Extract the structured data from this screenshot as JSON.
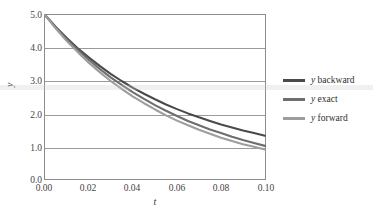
{
  "chart_data": {
    "type": "line",
    "title": "",
    "subtitle": "",
    "xlabel": "t",
    "ylabel": "y",
    "xlim": [
      0.0,
      0.1
    ],
    "ylim": [
      0.0,
      5.0
    ],
    "xticks": [
      "0.00",
      "0.02",
      "0.04",
      "0.06",
      "0.08",
      "0.10"
    ],
    "xtick_values": [
      0.0,
      0.02,
      0.04,
      0.06,
      0.08,
      0.1
    ],
    "yticks": [
      "0.0",
      "1.0",
      "2.0",
      "3.0",
      "4.0",
      "5.0"
    ],
    "ytick_values": [
      0.0,
      1.0,
      2.0,
      3.0,
      4.0,
      5.0
    ],
    "grid": "horizontal",
    "legend_position": "right",
    "x": [
      0.0,
      0.005,
      0.01,
      0.015,
      0.02,
      0.025,
      0.03,
      0.035,
      0.04,
      0.045,
      0.05,
      0.055,
      0.06,
      0.065,
      0.07,
      0.075,
      0.08,
      0.085,
      0.09,
      0.095,
      0.1
    ],
    "series": [
      {
        "name": "y backward",
        "color": "#4a4a4a",
        "values": [
          5.0,
          4.63,
          4.29,
          3.98,
          3.7,
          3.44,
          3.2,
          2.98,
          2.78,
          2.6,
          2.43,
          2.27,
          2.13,
          2.0,
          1.88,
          1.77,
          1.66,
          1.57,
          1.48,
          1.4,
          1.32
        ]
      },
      {
        "name": "y exact",
        "color": "#6e6e6e",
        "values": [
          5.0,
          4.61,
          4.25,
          3.93,
          3.63,
          3.35,
          3.09,
          2.86,
          2.64,
          2.44,
          2.25,
          2.08,
          1.92,
          1.77,
          1.64,
          1.51,
          1.4,
          1.29,
          1.19,
          1.1,
          1.01
        ]
      },
      {
        "name": "y forward",
        "color": "#9d9d9d",
        "values": [
          5.0,
          4.58,
          4.2,
          3.86,
          3.54,
          3.25,
          2.98,
          2.74,
          2.51,
          2.31,
          2.12,
          1.94,
          1.78,
          1.64,
          1.5,
          1.38,
          1.26,
          1.16,
          1.06,
          0.98,
          0.9
        ]
      }
    ]
  },
  "axes": {
    "xlabel": "t",
    "ylabel": "y"
  },
  "legend": {
    "items": [
      {
        "symbol": "y",
        "label": " backward",
        "color": "#4a4a4a"
      },
      {
        "symbol": "y",
        "label": " exact",
        "color": "#6e6e6e"
      },
      {
        "symbol": "y",
        "label": " forward",
        "color": "#9d9d9d"
      }
    ]
  },
  "ticks": {
    "x": [
      "0.00",
      "0.02",
      "0.04",
      "0.06",
      "0.08",
      "0.10"
    ],
    "y": [
      "5.0",
      "4.0",
      "3.0",
      "2.0",
      "1.0",
      "0.0"
    ]
  },
  "colors": {
    "frame": "#8c8c8c",
    "grid": "#9a9a9a",
    "text": "#3a3a3a",
    "background": "#ffffff"
  }
}
